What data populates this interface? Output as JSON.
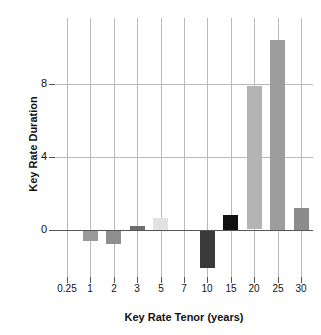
{
  "chart_data": {
    "type": "bar",
    "title": "",
    "xlabel": "Key Rate Tenor (years)",
    "ylabel": "Key Rate Duration",
    "categories": [
      "0.25",
      "1",
      "2",
      "3",
      "5",
      "7",
      "10",
      "15",
      "20",
      "25",
      "30"
    ],
    "values": [
      -0.05,
      -0.6,
      -0.75,
      0.2,
      0.65,
      -0.05,
      -2.1,
      0.8,
      7.85,
      10.4,
      1.2
    ],
    "bar_colors": [
      "#d8d8d8",
      "#9a9a9a",
      "#8e8e8e",
      "#6e6e6e",
      "#e2e2e2",
      "#6a6a6a",
      "#3a3a3a",
      "#111111",
      "#b4b4b4",
      "#9d9d9d",
      "#8c8c8c"
    ],
    "ylim": [
      -2.6,
      11.6
    ],
    "yticks": [
      0,
      4,
      8
    ],
    "ytick_labels": [
      "0",
      "4",
      "8"
    ],
    "grid": "both",
    "gridlines_y": [
      4,
      8
    ],
    "legend": "none",
    "annotations": []
  },
  "axes": {
    "y_title": "Key Rate Duration",
    "x_title": "Key Rate Tenor (years)"
  },
  "colors": {
    "grid": "#b9b9b9",
    "zero_line": "#555555",
    "text": "#111111",
    "background": "#ffffff"
  }
}
